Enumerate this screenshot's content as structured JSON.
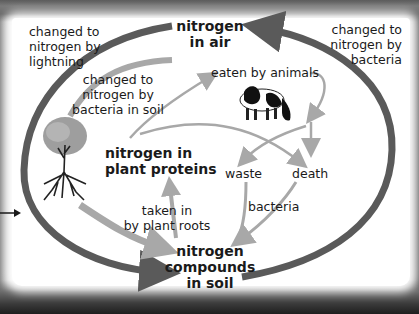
{
  "nodes": {
    "air": {
      "line1": "nitrogen",
      "line2": "in air"
    },
    "plant": {
      "line1": "nitrogen in",
      "line2": "plant proteins"
    },
    "soil": {
      "line1": "nitrogen",
      "line2": "compounds",
      "line3": "in soil"
    },
    "waste": "waste",
    "death": "death"
  },
  "edges": {
    "lightning": {
      "line1": "changed to",
      "line2": "nitrogen by",
      "line3": "lightning"
    },
    "bacteria_soil": {
      "line1": "changed to",
      "line2": "nitrogen by",
      "line3": "bacteria in soil"
    },
    "bacteria_air": {
      "line1": "changed to",
      "line2": "nitrogen by",
      "line3": "bacteria"
    },
    "eaten": "eaten by animals",
    "roots": {
      "line1": "taken in",
      "line2": "by plant roots"
    },
    "decay": "bacteria"
  },
  "illustrations": [
    "tree",
    "cow"
  ],
  "colors": {
    "dark_arrow": "#5a5a5a",
    "light_arrow": "#a8a8a8",
    "text": "#1a1a1a",
    "background": "#ffffff"
  }
}
